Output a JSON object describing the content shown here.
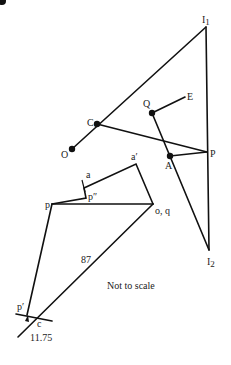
{
  "diagram": {
    "note": "Not to scale",
    "space_diagram": {
      "points": {
        "I1": {
          "label": "I",
          "sub": "1"
        },
        "I2": {
          "label": "I",
          "sub": "2"
        },
        "C": {
          "label": "C"
        },
        "O": {
          "label": "O"
        },
        "Q": {
          "label": "Q"
        },
        "E": {
          "label": "E"
        },
        "A": {
          "label": "A"
        },
        "P": {
          "label": "P"
        }
      }
    },
    "velocity_diagram": {
      "points": {
        "a_prime": {
          "label": "a′"
        },
        "a": {
          "label": "a"
        },
        "p_double_prime": {
          "label": "p″"
        },
        "p": {
          "label": "p"
        },
        "oq": {
          "label": "o, q"
        },
        "p_prime": {
          "label": "p′"
        },
        "c": {
          "label": "c"
        }
      },
      "dimensions": {
        "oc_length": "87",
        "pc_length": "11.75"
      }
    }
  }
}
